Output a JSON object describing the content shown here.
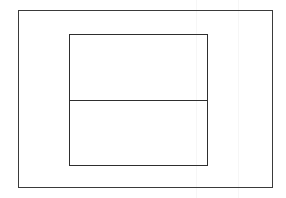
{
  "diagram": {
    "stroke_color": "#2e2e2e",
    "background_color": "#ffffff",
    "outer_frame": {
      "x": 18,
      "y": 10,
      "width": 255,
      "height": 178
    },
    "inner_frame": {
      "x": 69,
      "y": 34,
      "width": 139,
      "height": 132
    },
    "panels": [
      {
        "id": "top-panel",
        "label": ""
      },
      {
        "id": "bottom-panel",
        "label": ""
      }
    ]
  }
}
